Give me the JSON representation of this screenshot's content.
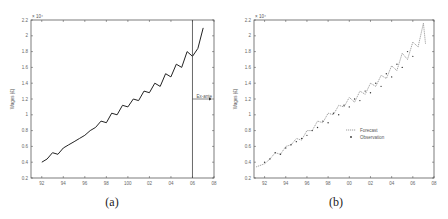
{
  "chart_data": [
    {
      "type": "line",
      "panel": "(a)",
      "title": "",
      "xlabel": "",
      "ylabel": "Wages (£)",
      "y_multiplier": "x 10^4",
      "xticks": [
        "92",
        "94",
        "96",
        "98",
        "100",
        "02",
        "04",
        "06",
        "08"
      ],
      "yticks": [
        "0.2",
        "0.4",
        "0.6",
        "0.8",
        "1",
        "1.2",
        "1.4",
        "1.6",
        "1.8",
        "2",
        "2.2"
      ],
      "ylim": [
        0.2,
        2.2
      ],
      "xlim": [
        91,
        108
      ],
      "grid": false,
      "annotations": [
        {
          "text": "Ex-ante",
          "x": 106,
          "y": 1.2,
          "type": "arrow-right"
        }
      ],
      "vertical_line_x": 106,
      "series": [
        {
          "name": "Wages",
          "style": "solid",
          "x": [
            92,
            92.5,
            93,
            93.5,
            94,
            94.5,
            95,
            95.5,
            96,
            96.5,
            97,
            97.5,
            98,
            98.5,
            99,
            99.5,
            100,
            100.5,
            101,
            101.5,
            102,
            102.5,
            103,
            103.5,
            104,
            104.5,
            105,
            105.5,
            106,
            106.5,
            107
          ],
          "y": [
            0.4,
            0.44,
            0.52,
            0.5,
            0.58,
            0.62,
            0.66,
            0.7,
            0.74,
            0.8,
            0.84,
            0.92,
            0.9,
            1.02,
            1.0,
            1.12,
            1.1,
            1.2,
            1.18,
            1.3,
            1.28,
            1.4,
            1.36,
            1.52,
            1.48,
            1.64,
            1.6,
            1.8,
            1.74,
            1.84,
            2.1
          ]
        }
      ]
    },
    {
      "type": "line",
      "panel": "(b)",
      "title": "",
      "xlabel": "",
      "ylabel": "Wages (£)",
      "y_multiplier": "x 10^4",
      "xticks": [
        "92",
        "94",
        "96",
        "98",
        "00",
        "02",
        "04",
        "06",
        "08"
      ],
      "yticks": [
        "0.2",
        "0.4",
        "0.6",
        "0.8",
        "1",
        "1.2",
        "1.4",
        "1.6",
        "1.8",
        "2",
        "2.2"
      ],
      "ylim": [
        0.2,
        2.2
      ],
      "xlim": [
        91,
        108
      ],
      "grid": false,
      "legend": {
        "position": "center-right",
        "entries": [
          "Forecast",
          "Observation"
        ]
      },
      "series": [
        {
          "name": "Forecast",
          "style": "dotted",
          "x": [
            91.2,
            92,
            92.5,
            93,
            93.5,
            94,
            94.5,
            95,
            95.5,
            96,
            96.5,
            97,
            97.5,
            98,
            98.5,
            99,
            99.5,
            100,
            100.5,
            101,
            101.5,
            102,
            102.5,
            103,
            103.5,
            104,
            104.5,
            105,
            105.5,
            106,
            106.5,
            107,
            107.2
          ],
          "y": [
            0.34,
            0.38,
            0.44,
            0.52,
            0.5,
            0.6,
            0.62,
            0.7,
            0.68,
            0.8,
            0.8,
            0.92,
            0.9,
            1.02,
            1.0,
            1.12,
            1.1,
            1.22,
            1.16,
            1.3,
            1.26,
            1.4,
            1.36,
            1.5,
            1.46,
            1.62,
            1.56,
            1.78,
            1.7,
            1.92,
            1.86,
            2.16,
            1.9
          ]
        },
        {
          "name": "Observation",
          "style": "marker",
          "x": [
            92,
            92.5,
            93,
            93.5,
            94,
            94.5,
            95,
            95.5,
            96,
            96.5,
            97,
            97.5,
            98,
            98.5,
            99,
            99.5,
            100,
            100.5,
            101,
            101.5,
            102,
            102.5,
            103,
            103.5,
            104,
            104.5,
            105,
            105.5,
            106
          ],
          "y": [
            0.4,
            0.44,
            0.52,
            0.5,
            0.58,
            0.62,
            0.66,
            0.7,
            0.74,
            0.8,
            0.84,
            0.92,
            0.9,
            1.02,
            1.0,
            1.12,
            1.1,
            1.2,
            1.18,
            1.3,
            1.28,
            1.4,
            1.36,
            1.52,
            1.48,
            1.64,
            1.6,
            1.8,
            1.74
          ]
        }
      ]
    }
  ],
  "panels": [
    {
      "caption": "(a)",
      "ylabel": "Wages (£)",
      "multiplier": "× 10⁴",
      "annotation": "Ex-ante"
    },
    {
      "caption": "(b)",
      "ylabel": "Wages (£)",
      "multiplier": "× 10⁴",
      "legend": [
        "Forecast",
        "Observation"
      ]
    }
  ]
}
